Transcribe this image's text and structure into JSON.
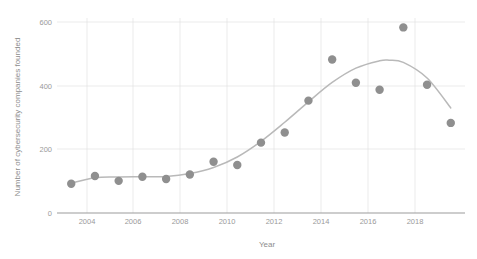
{
  "chart_data": {
    "type": "scatter",
    "title": "",
    "xlabel": "Year",
    "ylabel": "Number of cybersecurity companies founded",
    "xlim": [
      2002.4,
      2019.6
    ],
    "ylim": [
      0,
      620
    ],
    "grid": true,
    "legend": "none",
    "x_ticks": [
      2004,
      2006,
      2008,
      2010,
      2012,
      2014,
      2016,
      2018
    ],
    "x_tick_labels": [
      "2004",
      "2006",
      "2008",
      "2010",
      "2012",
      "2014",
      "2016",
      "2018"
    ],
    "y_ticks": [
      0,
      200,
      400,
      600
    ],
    "y_tick_labels": [
      "0",
      "200",
      "400",
      "600"
    ],
    "x": [
      2003,
      2004,
      2005,
      2006,
      2007,
      2008,
      2009,
      2010,
      2011,
      2012,
      2013,
      2014,
      2015,
      2016,
      2017,
      2018,
      2019
    ],
    "values": [
      92,
      116,
      101,
      114,
      107,
      121,
      161,
      151,
      221,
      253,
      353,
      482,
      409,
      387,
      583,
      403,
      283
    ],
    "series": [
      {
        "name": "Companies founded",
        "marker": "circle",
        "marker_color": "#8f8f8f",
        "marker_size": 5,
        "values": [
          92,
          116,
          101,
          114,
          107,
          121,
          161,
          151,
          221,
          253,
          353,
          482,
          409,
          387,
          583,
          403,
          283
        ]
      }
    ],
    "trend": {
      "name": "fitted trend curve",
      "color": "#b9b9b9",
      "x": [
        2003,
        2004,
        2005,
        2006,
        2007,
        2008,
        2009,
        2010,
        2011,
        2012,
        2013,
        2014,
        2015,
        2016,
        2016.4,
        2017,
        2018,
        2019
      ],
      "values": [
        94,
        111,
        113,
        114,
        115,
        124,
        143,
        176,
        225,
        285,
        349,
        410,
        455,
        478,
        480,
        473,
        424,
        330
      ]
    },
    "colors": {
      "marker": "#8f8f8f",
      "trend_line": "#b9b9b9",
      "gridline": "#e2e2e2",
      "axis": "#9b9b9b",
      "text": "#8d8d8d",
      "background": "#ffffff"
    }
  }
}
